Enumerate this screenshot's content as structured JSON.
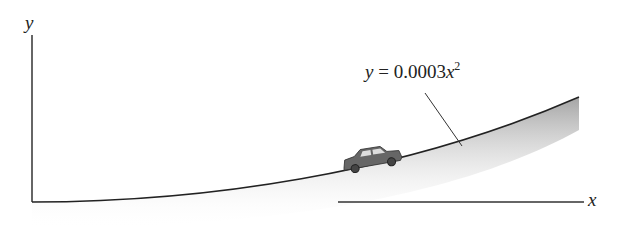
{
  "diagram": {
    "axis_y_label": "y",
    "axis_x_label": "x",
    "equation": {
      "lhs": "y",
      "eq": " = 0.0003",
      "var": "x",
      "exp": "2"
    },
    "colors": {
      "line": "#333333",
      "shade": "#9a9a9a",
      "car": "#555555"
    }
  }
}
